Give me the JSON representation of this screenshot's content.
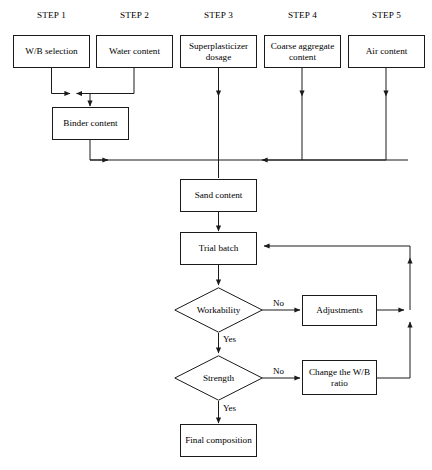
{
  "diagram": {
    "line_color": "#1a1a1a",
    "background": "#ffffff"
  },
  "step_labels": [
    {
      "id": "step1",
      "text": "STEP 1"
    },
    {
      "id": "step2",
      "text": "STEP 2"
    },
    {
      "id": "step3",
      "text": "STEP 3"
    },
    {
      "id": "step4",
      "text": "STEP 4"
    },
    {
      "id": "step5",
      "text": "STEP 5"
    }
  ],
  "process_boxes": {
    "wb_selection": "W/B selection",
    "water_content": "Water content",
    "superplasticizer_dosage": "Superplasticizer dosage",
    "coarse_aggregate_content": "Coarse aggregate content",
    "air_content": "Air content",
    "binder_content": "Binder content",
    "sand_content": "Sand content",
    "trial_batch": "Trial batch",
    "adjustments": "Adjustments",
    "change_wb_ratio": "Change the W/B ratio",
    "final_composition": "Final composition"
  },
  "decisions": {
    "workability": "Workability",
    "strength": "Strength"
  },
  "edge_labels": {
    "workability_no": "No",
    "workability_yes": "Yes",
    "strength_no": "No",
    "strength_yes": "Yes"
  }
}
